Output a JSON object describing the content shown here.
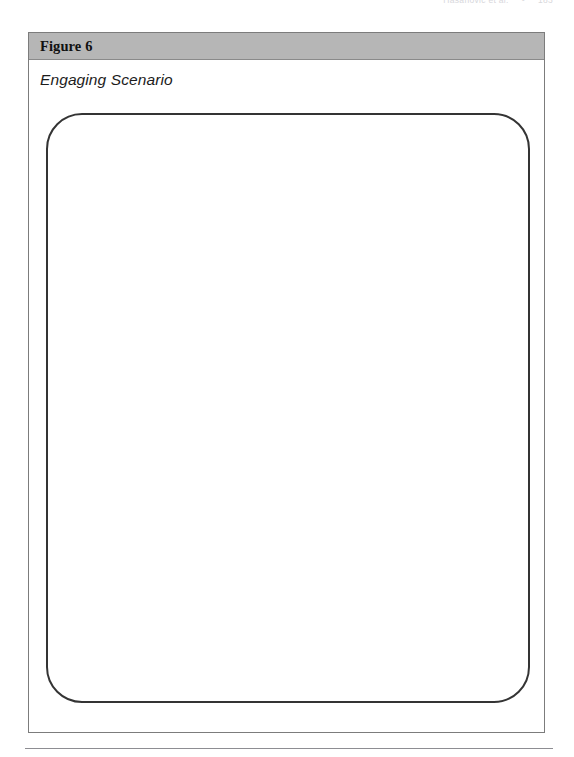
{
  "page": {
    "running_head": {
      "text": "Hasanovic et al.",
      "separator": "•",
      "page_number": "183"
    }
  },
  "figure": {
    "band_label": "Figure 6",
    "caption": "Engaging Scenario",
    "content": "",
    "colors": {
      "band_background": "#b6b6b6",
      "frame_border": "#7c7c7c",
      "content_box_border": "#343434",
      "page_background": "#ffffff",
      "footer_rule": "#8d8d92"
    }
  }
}
